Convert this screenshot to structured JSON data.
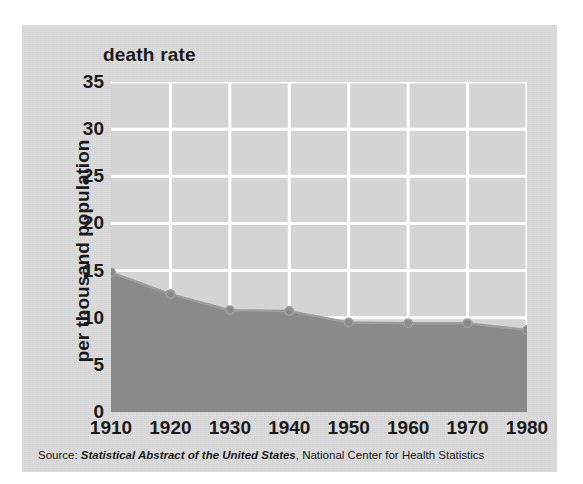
{
  "figure": {
    "background": "#ffffff",
    "panel_color": "#d9d9d9",
    "plot_color": "#d4d4d4",
    "grid_color": "#ffffff",
    "series_fill": "#8a8a8a",
    "series_line": "#9e9e9e",
    "text_color": "#1a1a1a"
  },
  "source_note": {
    "prefix": "Source:",
    "italic_part": "Statistical Abstract of the United States",
    "suffix": ", National Center for Health Statistics",
    "full": "Source: Statistical Abstract of the United States, National Center for Health Statistics"
  },
  "chart_data": {
    "type": "area",
    "title": "death rate",
    "xlabel": "",
    "ylabel": "per thousand population",
    "x": [
      1910,
      1920,
      1930,
      1940,
      1950,
      1960,
      1970,
      1980
    ],
    "xticklabels": [
      "1910",
      "1920",
      "1930",
      "1940",
      "1950",
      "1960",
      "1970",
      "1980"
    ],
    "values": [
      14.8,
      12.5,
      10.8,
      10.7,
      9.5,
      9.4,
      9.4,
      8.7
    ],
    "yticks": [
      0,
      5,
      10,
      15,
      20,
      25,
      30,
      35
    ],
    "yticklabels": [
      "0",
      "5",
      "10",
      "15",
      "20",
      "25",
      "30",
      "35"
    ],
    "ylim": [
      0,
      35
    ],
    "xlim": [
      1910,
      1980
    ],
    "grid": true,
    "grid_orientation": "both",
    "legend": false,
    "markers": true,
    "units": "deaths per thousand population"
  }
}
